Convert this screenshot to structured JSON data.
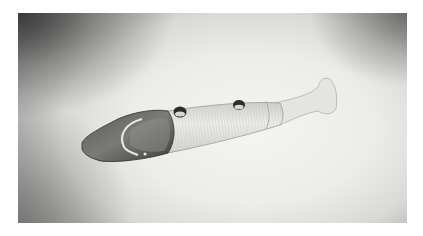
{
  "image": {
    "subject": "fish-shaped whistle",
    "description": "Black-and-white photograph of a carved fish-shaped wind instrument with two finger holes, a dark head with a crescent mouthpiece, a ribbed body, and a flared tail",
    "style": "monochrome photograph",
    "colors": {
      "background_light": "#f0f0ee",
      "background_dark": "#3a3a3a",
      "object_head": "#4a4a48",
      "object_body": "#dcdcd8",
      "holes": "#2a2a2a"
    }
  }
}
